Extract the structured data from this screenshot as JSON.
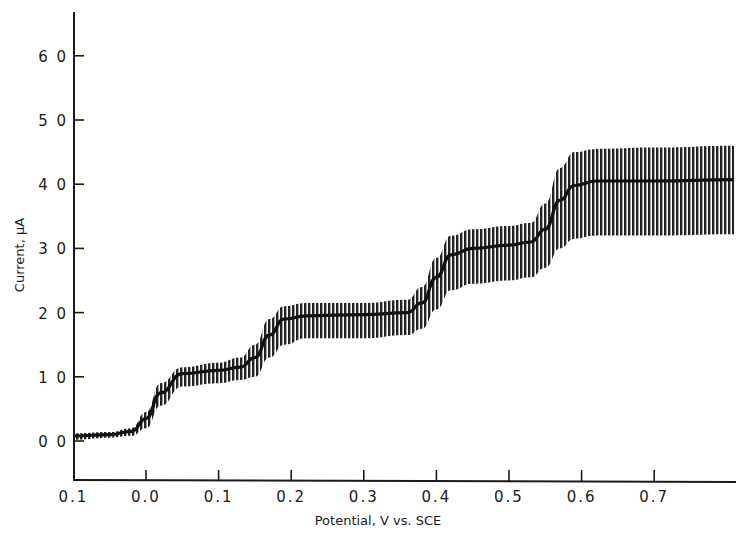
{
  "chart_data": {
    "type": "line",
    "title": "",
    "xlabel": "Potential, V vs. SCE",
    "ylabel": "Current, μA",
    "x_tick_labels": [
      "0.1",
      "0.0",
      "0.1",
      "0.2",
      "0.3",
      "0.4",
      "0.5",
      "0.6",
      "0.7"
    ],
    "x_tick_values": [
      -0.1,
      0.0,
      0.1,
      0.2,
      0.3,
      0.4,
      0.5,
      0.6,
      0.7
    ],
    "y_tick_labels": [
      "0.0",
      "1.0",
      "2.0",
      "3.0",
      "4.0",
      "5.0",
      "6.0"
    ],
    "y_tick_values": [
      0,
      1,
      2,
      3,
      4,
      5,
      6
    ],
    "xlim": [
      -0.1,
      0.81
    ],
    "ylim": [
      -0.6,
      6.6
    ],
    "grid": false,
    "legend": null,
    "series": [
      {
        "name": "mean current",
        "x": [
          -0.1,
          -0.05,
          -0.02,
          0.0,
          0.02,
          0.05,
          0.1,
          0.13,
          0.15,
          0.17,
          0.19,
          0.22,
          0.3,
          0.36,
          0.38,
          0.4,
          0.42,
          0.45,
          0.5,
          0.53,
          0.55,
          0.57,
          0.59,
          0.62,
          0.7,
          0.81
        ],
        "y": [
          0.08,
          0.1,
          0.15,
          0.35,
          0.75,
          1.05,
          1.1,
          1.15,
          1.3,
          1.65,
          1.9,
          1.95,
          1.97,
          2.0,
          2.15,
          2.55,
          2.9,
          3.0,
          3.05,
          3.1,
          3.3,
          3.75,
          3.98,
          4.05,
          4.05,
          4.07
        ]
      },
      {
        "name": "envelope upper",
        "x": [
          -0.1,
          -0.05,
          -0.02,
          0.0,
          0.02,
          0.05,
          0.1,
          0.13,
          0.15,
          0.17,
          0.19,
          0.22,
          0.3,
          0.36,
          0.38,
          0.4,
          0.42,
          0.45,
          0.5,
          0.53,
          0.55,
          0.57,
          0.59,
          0.62,
          0.7,
          0.81
        ],
        "y": [
          0.12,
          0.14,
          0.2,
          0.45,
          0.9,
          1.15,
          1.22,
          1.3,
          1.5,
          1.9,
          2.1,
          2.15,
          2.15,
          2.2,
          2.4,
          2.85,
          3.2,
          3.3,
          3.35,
          3.4,
          3.7,
          4.25,
          4.5,
          4.55,
          4.57,
          4.6
        ]
      },
      {
        "name": "envelope lower",
        "x": [
          -0.1,
          -0.05,
          -0.02,
          0.0,
          0.02,
          0.05,
          0.1,
          0.13,
          0.15,
          0.17,
          0.19,
          0.22,
          0.3,
          0.36,
          0.38,
          0.4,
          0.42,
          0.45,
          0.5,
          0.53,
          0.55,
          0.57,
          0.59,
          0.62,
          0.7,
          0.81
        ],
        "y": [
          0.02,
          0.05,
          0.08,
          0.2,
          0.55,
          0.85,
          0.9,
          0.95,
          1.0,
          1.3,
          1.5,
          1.6,
          1.6,
          1.65,
          1.75,
          2.05,
          2.35,
          2.45,
          2.5,
          2.55,
          2.7,
          3.0,
          3.15,
          3.2,
          3.2,
          3.22
        ]
      }
    ],
    "plateaus": [
      {
        "wave": 0,
        "potential_range": [
          -0.1,
          -0.02
        ],
        "current": 0.1
      },
      {
        "wave": 1,
        "potential_range": [
          0.05,
          0.13
        ],
        "current": 1.1
      },
      {
        "wave": 2,
        "potential_range": [
          0.2,
          0.37
        ],
        "current": 1.97
      },
      {
        "wave": 3,
        "potential_range": [
          0.44,
          0.54
        ],
        "current": 3.05
      },
      {
        "wave": 4,
        "potential_range": [
          0.6,
          0.81
        ],
        "current": 4.06
      }
    ]
  },
  "axes": {
    "x_title": "Potential, V vs. SCE",
    "y_title": "Current, μA"
  },
  "colors": {
    "ink": "#1a1a1a",
    "band": "#2a2a2a",
    "background": "#ffffff"
  }
}
